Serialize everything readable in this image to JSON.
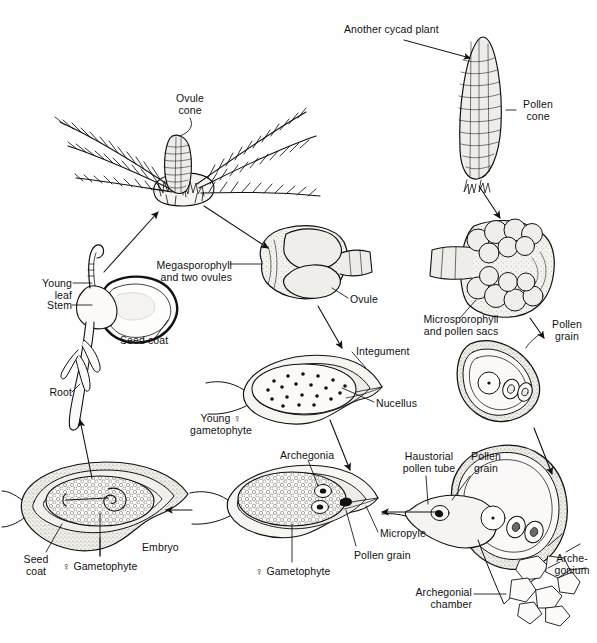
{
  "figure": {
    "ink_color": "#111111",
    "fill_light": "#f2f0ec",
    "fill_mid": "#e2ded7",
    "background": "#fefefe"
  },
  "labels": {
    "ovule_cone": "Ovule\ncone",
    "another_cycad_plant": "Another cycad plant",
    "pollen_cone": "Pollen\ncone",
    "young_leaf": "Young\nleaf",
    "stem": "Stem",
    "seed_coat_top": "Seed coat",
    "root": "Root",
    "megasporophyll_and_two_ovules": "Megasporophyll\nand two ovules",
    "ovule": "Ovule",
    "microsporophyll_and_pollen_sacs": "Microsporophyll\nand pollen sacs",
    "pollen_grain_right": "Pollen\ngrain",
    "integument": "Integument",
    "nucellus": "Nucellus",
    "young_female_gametophyte": "Young ♀\ngametophyte",
    "archegonia": "Archegonia",
    "haustorial_pollen_tube": "Haustorial\npollen tube",
    "pollen_grain_tube": "Pollen\ngrain",
    "micropyle": "Micropyle",
    "pollen_grain_ovule": "Pollen grain",
    "female_gametophyte_mid": "♀ Gametophyte",
    "archegonial_chamber": "Archegonial\nchamber",
    "archegonium": "Arche-\ngonium",
    "embryo": "Embryo",
    "seed_coat_bottom": "Seed\ncoat",
    "female_gametophyte_seed": "♀ Gametophyte"
  },
  "stages": [
    {
      "id": "ovulate-plant",
      "name": "Ovulate cycad plant with ovule cone"
    },
    {
      "id": "pollen-plant",
      "name": "Another cycad plant with pollen cone"
    },
    {
      "id": "megasporophyll",
      "name": "Megasporophyll bearing two ovules"
    },
    {
      "id": "microsporophyll",
      "name": "Microsporophyll with pollen sacs"
    },
    {
      "id": "young-ovule",
      "name": "Young ovule with female gametophyte"
    },
    {
      "id": "pollen-grain",
      "name": "Pollen grain"
    },
    {
      "id": "mature-ovule",
      "name": "Ovule with archegonia and pollen grain"
    },
    {
      "id": "fertilization",
      "name": "Haustorial pollen tube at archegonial chamber"
    },
    {
      "id": "seed",
      "name": "Seed with embryo"
    },
    {
      "id": "seedling",
      "name": "Germinating seedling"
    }
  ],
  "arrows": [
    {
      "from": "seedling",
      "to": "ovulate-plant"
    },
    {
      "from": "ovulate-plant",
      "to": "megasporophyll"
    },
    {
      "from": "pollen-plant",
      "to": "microsporophyll"
    },
    {
      "from": "megasporophyll",
      "to": "young-ovule"
    },
    {
      "from": "microsporophyll",
      "to": "pollen-grain"
    },
    {
      "from": "young-ovule",
      "to": "mature-ovule"
    },
    {
      "from": "pollen-grain",
      "to": "fertilization"
    },
    {
      "from": "fertilization",
      "to": "mature-ovule"
    },
    {
      "from": "mature-ovule",
      "to": "seed"
    },
    {
      "from": "seed",
      "to": "seedling"
    }
  ]
}
